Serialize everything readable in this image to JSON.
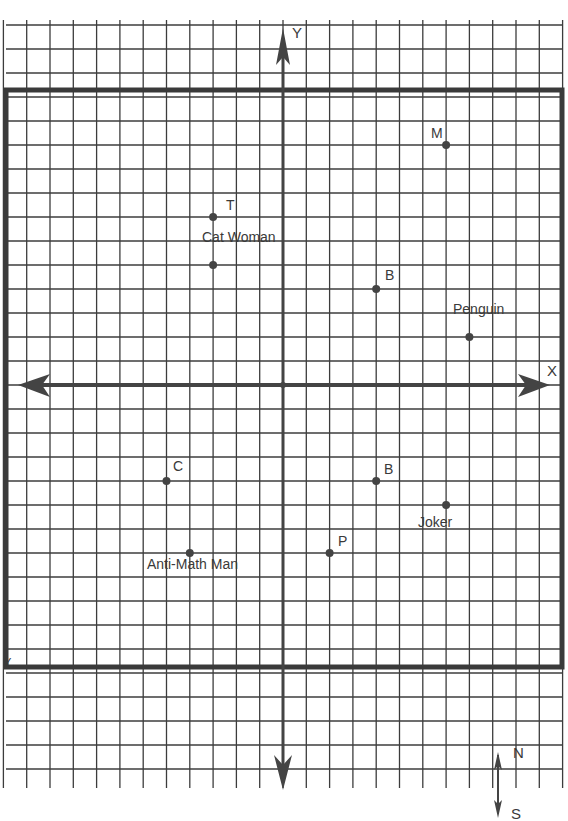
{
  "page": {
    "title_cut_off": "",
    "grid": {
      "origin_px": [
        283,
        385
      ],
      "unit_x_px": 23.3,
      "unit_y_px": 24.0,
      "x_range_units": [
        -12,
        12
      ],
      "y_range_units": [
        -17,
        15
      ],
      "line_color": "#3c3c3c",
      "border_color": "#3a3a3a"
    },
    "axes": {
      "x_label": "X",
      "y_label": "Y",
      "border_corner_label_bottom_left": "Y"
    },
    "compass": {
      "north_label": "N",
      "south_label": "S"
    }
  },
  "chart_data": {
    "type": "scatter",
    "title": "",
    "xlabel": "X",
    "ylabel": "Y",
    "xlim": [
      -12,
      12
    ],
    "ylim": [
      -12,
      12
    ],
    "grid": true,
    "points": [
      {
        "label": "M",
        "x": 7,
        "y": 10
      },
      {
        "label": "T",
        "x": -3,
        "y": 7
      },
      {
        "label": "Cat Woman",
        "x": -3,
        "y": 5
      },
      {
        "label": "B",
        "x": 4,
        "y": 4
      },
      {
        "label": "Penguin",
        "x": 8,
        "y": 2
      },
      {
        "label": "C",
        "x": -5,
        "y": -4
      },
      {
        "label": "B",
        "x": 4,
        "y": -4
      },
      {
        "label": "Joker",
        "x": 7,
        "y": -5
      },
      {
        "label": "P",
        "x": 2,
        "y": -7
      },
      {
        "label": "Anti-Math Man",
        "x": -4,
        "y": -7
      }
    ]
  },
  "labels": {
    "m": "M",
    "t": "T",
    "cat_woman": "Cat Woman",
    "b_top": "B",
    "penguin": "Penguin",
    "c": "C",
    "b_bottom": "B",
    "joker": "Joker",
    "p": "P",
    "anti_math_man": "Anti-Math Man"
  }
}
